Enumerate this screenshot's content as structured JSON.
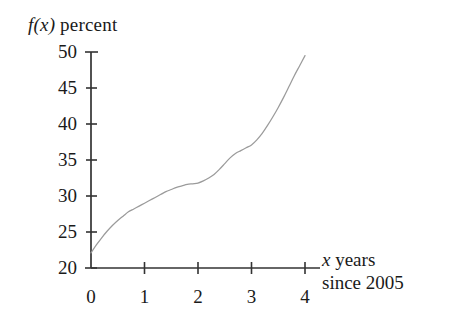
{
  "figure": {
    "background_color": "#ffffff",
    "axis_color": "#333333",
    "curve_color": "#9b9b9b"
  },
  "labels": {
    "y_axis_title_var": "f(x)",
    "y_axis_title_text": " percent",
    "x_axis_title_var": "x",
    "x_axis_title_text": " years",
    "x_axis_title_line2": "since 2005"
  },
  "y_ticks": [
    {
      "value": 50,
      "label": "50"
    },
    {
      "value": 45,
      "label": "45"
    },
    {
      "value": 40,
      "label": "40"
    },
    {
      "value": 35,
      "label": "35"
    },
    {
      "value": 30,
      "label": "30"
    },
    {
      "value": 25,
      "label": "25"
    },
    {
      "value": 20,
      "label": "20"
    }
  ],
  "x_ticks": [
    {
      "value": 0,
      "label": "0"
    },
    {
      "value": 1,
      "label": "1"
    },
    {
      "value": 2,
      "label": "2"
    },
    {
      "value": 3,
      "label": "3"
    },
    {
      "value": 4,
      "label": "4"
    }
  ],
  "chart_data": {
    "type": "line",
    "title": "",
    "subtitle": "",
    "xlabel": "x years since 2005",
    "ylabel": "f(x) percent",
    "xlim": [
      0,
      4
    ],
    "ylim": [
      20,
      50
    ],
    "xticks": [
      0,
      1,
      2,
      3,
      4
    ],
    "yticks": [
      20,
      25,
      30,
      35,
      40,
      45,
      50
    ],
    "grid": false,
    "legend": null,
    "annotations": [],
    "series": [
      {
        "name": "f(x)",
        "x": [
          0,
          0.1,
          0.2,
          0.3,
          0.4,
          0.5,
          0.6,
          0.7,
          0.8,
          0.9,
          1.0,
          1.1,
          1.2,
          1.3,
          1.4,
          1.5,
          1.6,
          1.7,
          1.8,
          1.9,
          2.0,
          2.1,
          2.2,
          2.3,
          2.4,
          2.5,
          2.6,
          2.7,
          2.8,
          2.9,
          3.0,
          3.1,
          3.2,
          3.3,
          3.4,
          3.5,
          3.6,
          3.7,
          3.8,
          3.9,
          4.0
        ],
        "y": [
          22.1,
          23.2,
          24.2,
          25.1,
          25.9,
          26.6,
          27.2,
          27.8,
          28.2,
          28.6,
          29.0,
          29.4,
          29.8,
          30.2,
          30.6,
          30.9,
          31.2,
          31.4,
          31.6,
          31.7,
          31.8,
          32.1,
          32.5,
          33.0,
          33.7,
          34.5,
          35.3,
          35.9,
          36.3,
          36.7,
          37.1,
          37.8,
          38.7,
          39.8,
          41.0,
          42.3,
          43.7,
          45.2,
          46.7,
          48.1,
          49.5
        ]
      }
    ]
  },
  "geometry": {
    "plot_left_px": 91,
    "plot_right_px": 305,
    "axis_extension_px": 320,
    "plot_top_px": 52,
    "plot_bottom_px": 268
  }
}
